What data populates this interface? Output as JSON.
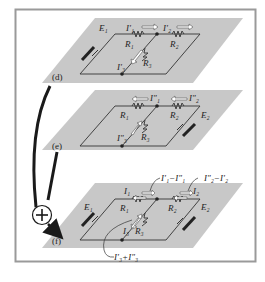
{
  "figure": {
    "frame_color": "#9a9a9a",
    "plane_color": "#c8c8c8",
    "wire_color": "#333333",
    "arrow_color": "#1a1a1a",
    "plus_symbol": "+",
    "panels": [
      {
        "id": "d",
        "label": "(d)",
        "source_left": "E₁",
        "resistors": [
          "R₁",
          "R₂",
          "R₃"
        ],
        "currents": [
          "I′₁",
          "I′₂",
          "I′₃"
        ]
      },
      {
        "id": "e",
        "label": "(e)",
        "source_right": "E₂",
        "resistors": [
          "R₁",
          "R₂",
          "R₃"
        ],
        "currents": [
          "I″₁",
          "I″₂",
          "I″₃"
        ]
      },
      {
        "id": "f",
        "label": "(f)",
        "source_left": "E₁",
        "source_right": "E₂",
        "resistors": [
          "R₁",
          "R₂",
          "R₃"
        ],
        "currents": [
          "I₁",
          "I₂",
          "I₃"
        ],
        "annotations": [
          "I′₁−I″₁",
          "I″₂−I′₂",
          "I′₃+I″₃"
        ]
      }
    ]
  }
}
